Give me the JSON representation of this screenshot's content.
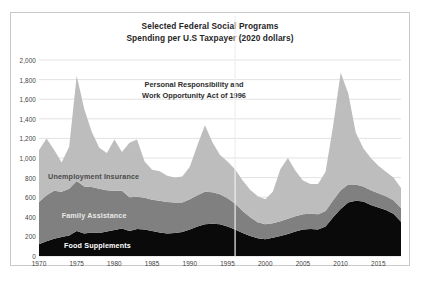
{
  "chart_data": {
    "type": "area",
    "stacked": true,
    "title": "Selected Federal Social Programs",
    "subtitle": "Spending per U.S Taxpayer (2020 dollars)",
    "xlabel": "",
    "ylabel": "",
    "ylim": [
      0,
      2000
    ],
    "xlim": [
      1970,
      2018
    ],
    "grid": true,
    "legend_position": "inline-labels",
    "yticks": [
      "0",
      "200",
      "400",
      "600",
      "800",
      "1,000",
      "1,200",
      "1,400",
      "1,600",
      "1,800",
      "2,000"
    ],
    "ytick_values": [
      0,
      200,
      400,
      600,
      800,
      1000,
      1200,
      1400,
      1600,
      1800,
      2000
    ],
    "xticks": [
      "1970",
      "1975",
      "1980",
      "1985",
      "1990",
      "1995",
      "2000",
      "2005",
      "2010",
      "2015"
    ],
    "xtick_values": [
      1970,
      1975,
      1980,
      1985,
      1990,
      1995,
      2000,
      2005,
      2010,
      2015
    ],
    "x": [
      1970,
      1971,
      1972,
      1973,
      1974,
      1975,
      1976,
      1977,
      1978,
      1979,
      1980,
      1981,
      1982,
      1983,
      1984,
      1985,
      1986,
      1987,
      1988,
      1989,
      1990,
      1991,
      1992,
      1993,
      1994,
      1995,
      1996,
      1997,
      1998,
      1999,
      2000,
      2001,
      2002,
      2003,
      2004,
      2005,
      2006,
      2007,
      2008,
      2009,
      2010,
      2011,
      2012,
      2013,
      2014,
      2015,
      2016,
      2017,
      2018
    ],
    "series": [
      {
        "name": "Food Supplements",
        "color": "#0a0a0a",
        "values": [
          120,
          150,
          175,
          195,
          210,
          255,
          230,
          240,
          235,
          250,
          265,
          280,
          255,
          275,
          270,
          255,
          240,
          230,
          235,
          245,
          270,
          300,
          325,
          330,
          325,
          300,
          270,
          235,
          205,
          180,
          170,
          185,
          205,
          225,
          250,
          270,
          275,
          270,
          300,
          395,
          480,
          545,
          565,
          555,
          520,
          495,
          470,
          430,
          350
        ]
      },
      {
        "name": "Family Assistance",
        "color": "#808080",
        "values": [
          430,
          470,
          490,
          460,
          475,
          510,
          480,
          465,
          450,
          420,
          400,
          385,
          345,
          330,
          325,
          320,
          325,
          320,
          310,
          300,
          310,
          320,
          330,
          320,
          305,
          290,
          265,
          225,
          190,
          165,
          155,
          150,
          150,
          155,
          155,
          155,
          155,
          155,
          160,
          175,
          190,
          185,
          165,
          155,
          150,
          145,
          140,
          140,
          140
        ]
      },
      {
        "name": "Unemployment Insurance",
        "color": "#bdbdbd",
        "values": [
          530,
          580,
          420,
          300,
          430,
          1075,
          790,
          560,
          420,
          380,
          525,
          395,
          555,
          585,
          370,
          305,
          300,
          270,
          255,
          265,
          330,
          510,
          680,
          510,
          400,
          375,
          350,
          310,
          280,
          265,
          255,
          320,
          530,
          620,
          465,
          345,
          305,
          310,
          400,
          760,
          1200,
          930,
          530,
          390,
          330,
          280,
          250,
          230,
          205
        ]
      }
    ],
    "annotations": [
      {
        "name": "prwora-note",
        "line1": "Personal Responsibility  and",
        "line2": "Work Opportunity  Act of 1996",
        "marker_x": 1996
      }
    ],
    "inline_labels": [
      {
        "name": "unemployment-insurance",
        "text": "Unemployment Insurance"
      },
      {
        "name": "family-assistance",
        "text": "Family Assistance"
      },
      {
        "name": "food-supplements",
        "text": "Food Supplements"
      }
    ],
    "colors": {
      "food_supplements": "#0a0a0a",
      "family_assistance": "#808080",
      "unemployment_insurance": "#bdbdbd",
      "gridline": "#d6d6d6",
      "border": "#c9c9c9",
      "marker_line": "#efefef",
      "text": "#262626"
    }
  }
}
